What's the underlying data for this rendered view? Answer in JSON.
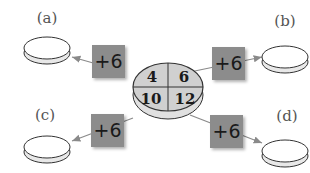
{
  "diagram": {
    "center": {
      "cells": [
        "4",
        "6",
        "10",
        "12"
      ]
    },
    "operations": [
      {
        "label": "+6",
        "target": "a"
      },
      {
        "label": "+6",
        "target": "b"
      },
      {
        "label": "+6",
        "target": "c"
      },
      {
        "label": "+6",
        "target": "d"
      }
    ],
    "outputs": [
      {
        "label": "(a)"
      },
      {
        "label": "(b)"
      },
      {
        "label": "(c)"
      },
      {
        "label": "(d)"
      }
    ]
  },
  "colors": {
    "op_box": "#8c8c8c",
    "center_fill": "#d0d0d0",
    "disc_fill": "#ffffff",
    "arrow": "#8a8a8a"
  }
}
